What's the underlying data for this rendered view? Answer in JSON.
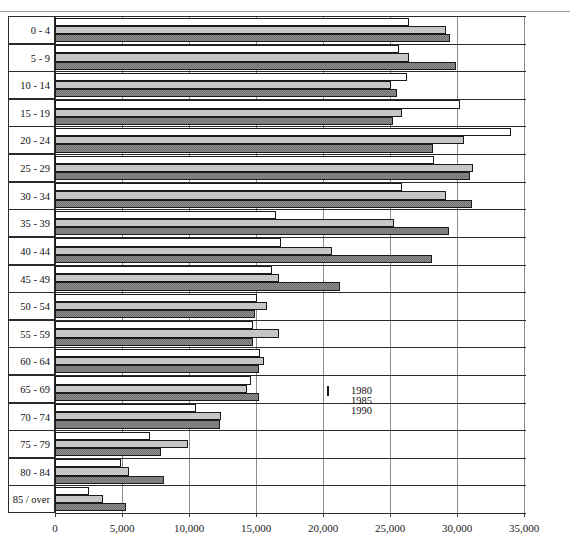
{
  "header": {
    "caption": ""
  },
  "chart_data": {
    "type": "bar",
    "orientation": "horizontal",
    "title": "",
    "xlabel": "",
    "ylabel": "",
    "xlim": [
      0,
      37000
    ],
    "xticks": [
      0,
      5000,
      10000,
      15000,
      20000,
      25000,
      30000,
      35000
    ],
    "xticklabels": [
      "0",
      "5,000",
      "10,000",
      "15,000",
      "20,000",
      "25,000",
      "30,000",
      "35,000"
    ],
    "grid": true,
    "legend_position": "center-right",
    "categories": [
      "0 - 4",
      "5 - 9",
      "10 - 14",
      "15 - 19",
      "20 - 24",
      "25 - 29",
      "30 - 34",
      "35 - 39",
      "40 - 44",
      "45 - 49",
      "50 - 54",
      "55 - 59",
      "60 - 64",
      "65 - 69",
      "70 - 74",
      "75 - 79",
      "80 - 84",
      "85 / over"
    ],
    "series": [
      {
        "name": "1980",
        "color": "#ffffff",
        "values": [
          26400,
          25700,
          26300,
          30200,
          34000,
          28300,
          25900,
          16500,
          16900,
          16200,
          15100,
          14800,
          15300,
          14600,
          10500,
          7100,
          4900,
          2500
        ]
      },
      {
        "name": "1985",
        "color": "#cfcfcf",
        "values": [
          29200,
          26400,
          25100,
          25900,
          30500,
          31200,
          29200,
          25300,
          20700,
          16700,
          15800,
          16700,
          15600,
          14300,
          12400,
          9900,
          5500,
          3600
        ]
      },
      {
        "name": "1990",
        "color": "#8f8f8f",
        "values": [
          29500,
          29900,
          25500,
          25200,
          28200,
          31000,
          31100,
          29400,
          28100,
          21300,
          14900,
          14800,
          15200,
          15200,
          12300,
          7900,
          8100,
          5300
        ]
      }
    ]
  },
  "legend": {
    "items": [
      {
        "label": "1980",
        "swatch": "white"
      },
      {
        "label": "1985",
        "swatch": "light-hatch"
      },
      {
        "label": "1990",
        "swatch": "dark-hatch"
      }
    ]
  }
}
